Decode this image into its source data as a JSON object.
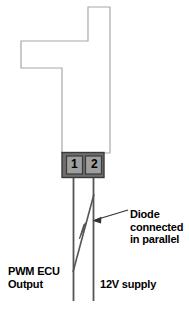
{
  "diagram": {
    "colors": {
      "background": "#ffffff",
      "outline_stroke": "#a8a8a8",
      "connector_fill": "#6e6e6e",
      "connector_stroke": "#333333",
      "pin_fill": "#9a9a9a",
      "wire_stroke": "#555555",
      "diode_stroke": "#555555",
      "leader_stroke": "#333333",
      "text": "#000000"
    },
    "component": {
      "name": "solenoid-body-outline",
      "shape": "stepped-L-outline"
    },
    "connector": {
      "name": "two-pin-connector",
      "pins": [
        {
          "number": "1",
          "function": "PWM ECU Output"
        },
        {
          "number": "2",
          "function": "12V supply"
        }
      ]
    },
    "labels": {
      "diode": "Diode\nconnected\nin parallel",
      "diode_lines": [
        "Diode",
        "connected",
        "in parallel"
      ],
      "pwm_output": "PWM ECU\nOutput",
      "pwm_output_lines": [
        "PWM ECU",
        "Output"
      ],
      "supply": "12V supply"
    },
    "annotations": {
      "leader_target": "diode-symbol",
      "diode_direction": "up-right"
    }
  }
}
